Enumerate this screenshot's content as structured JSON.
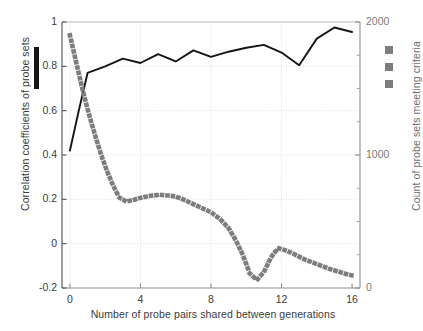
{
  "chart_data": {
    "type": "line",
    "title": "",
    "xlabel": "Number of probe pairs shared between generations",
    "ylabel": "Correlation coefficients of probe sets",
    "ylabel_right": "Count of probe sets meeting criteria",
    "xlim": [
      -0.45,
      16.45
    ],
    "ylim": [
      -0.2,
      1.0
    ],
    "ylim_right": [
      0,
      2000
    ],
    "xticks": [
      0,
      4,
      8,
      12,
      16
    ],
    "xticklabels": [
      "0",
      "4",
      "8",
      "12",
      "16"
    ],
    "yticks": [
      -0.2,
      0,
      0.2,
      0.4,
      0.6,
      0.8,
      1
    ],
    "yticklabels": [
      "-0.2",
      "0",
      "0.2",
      "0.4",
      "0.6",
      "0.8",
      "1"
    ],
    "yticks_right": [
      0,
      1000,
      2000
    ],
    "yticklabels_right": [
      "0",
      "1000",
      "2000"
    ],
    "yminorticks_right": [
      250,
      500,
      750,
      1250,
      1500,
      1750
    ],
    "grid": true,
    "legend_position": "outside-left-and-right",
    "series": [
      {
        "name": "Correlation coefficients of probe sets",
        "axis": "left",
        "style": "solid",
        "color": "#151515",
        "legend_marker": "vertical-bar",
        "x": [
          0,
          0.5,
          1,
          2,
          3,
          4,
          5,
          6,
          7,
          8,
          9,
          10,
          11,
          12,
          13,
          14,
          15,
          16
        ],
        "y": [
          0.42,
          0.6,
          0.77,
          0.8,
          0.835,
          0.815,
          0.855,
          0.822,
          0.872,
          0.843,
          0.866,
          0.884,
          0.897,
          0.862,
          0.805,
          0.925,
          0.975,
          0.955
        ]
      },
      {
        "name": "Count of probe sets meeting criteria",
        "axis": "right",
        "style": "dotted",
        "color": "#7d7d7d",
        "legend_marker": "square",
        "x": [
          0,
          0.35,
          0.7,
          1.05,
          1.4,
          1.75,
          2.1,
          2.45,
          2.8,
          3.2,
          3.6,
          4.0,
          4.4,
          4.8,
          5.2,
          5.6,
          6.0,
          6.5,
          7.0,
          7.5,
          8.0,
          8.5,
          9.0,
          9.4,
          9.8,
          10.2,
          10.6,
          11.0,
          11.4,
          11.8,
          12.3,
          12.8,
          13.3,
          13.8,
          14.3,
          14.8,
          15.3,
          15.8,
          16.0
        ],
        "y": [
          1900,
          1700,
          1500,
          1320,
          1160,
          1010,
          880,
          770,
          680,
          650,
          662,
          678,
          690,
          698,
          700,
          695,
          688,
          662,
          630,
          600,
          570,
          520,
          450,
          360,
          250,
          110,
          60,
          120,
          230,
          300,
          280,
          250,
          215,
          190,
          165,
          140,
          120,
          100,
          95
        ]
      }
    ]
  },
  "legend": {
    "left_marker": "solid-line-swatch",
    "right_marker": "dotted-line-swatch"
  }
}
